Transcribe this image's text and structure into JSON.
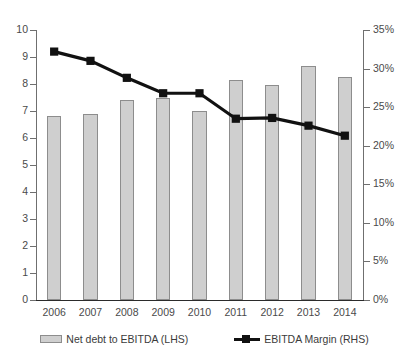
{
  "chart_data": {
    "type": "bar",
    "title": "",
    "subtitle": "",
    "xlabel": "",
    "ylabel": "",
    "grid": false,
    "legend_position": "bottom",
    "categories": [
      "2006",
      "2007",
      "2008",
      "2009",
      "2010",
      "2011",
      "2012",
      "2013",
      "2014"
    ],
    "axes": {
      "left": {
        "label": "",
        "min": 0,
        "max": 10,
        "step": 1,
        "ticks": [
          "0",
          "1",
          "2",
          "3",
          "4",
          "5",
          "6",
          "7",
          "8",
          "9",
          "10"
        ],
        "tick_values": [
          0,
          1,
          2,
          3,
          4,
          5,
          6,
          7,
          8,
          9,
          10
        ]
      },
      "right": {
        "label": "",
        "min": 0,
        "max": 35,
        "step": 5,
        "ticks": [
          "0%",
          "5%",
          "10%",
          "15%",
          "20%",
          "25%",
          "30%",
          "35%"
        ],
        "tick_values": [
          0,
          5,
          10,
          15,
          20,
          25,
          30,
          35
        ]
      }
    },
    "series": [
      {
        "name": "Net debt to EBITDA (LHS)",
        "type": "bar",
        "axis": "left",
        "color": "#cfcfcf",
        "border_color": "#8d8d8d",
        "values": [
          6.8,
          6.9,
          7.4,
          7.5,
          7.0,
          8.15,
          7.95,
          8.65,
          8.25
        ]
      },
      {
        "name": "EBITDA Margin (RHS)",
        "type": "line",
        "axis": "right",
        "color": "#111111",
        "marker": "square",
        "values": [
          32.2,
          31.0,
          28.8,
          26.8,
          26.8,
          23.5,
          23.6,
          22.6,
          21.3
        ]
      }
    ]
  },
  "legend": {
    "items": [
      {
        "label": "Net debt to EBITDA (LHS)",
        "swatch": "bar-swatch"
      },
      {
        "label": "EBITDA Margin (RHS)",
        "swatch": "line-marker-swatch"
      }
    ]
  },
  "colors": {
    "bar_fill": "#cfcfcf",
    "bar_border": "#8d8d8d",
    "line": "#111111",
    "axis": "#6f6f6f",
    "text": "#3b3b3b",
    "background": "#ffffff"
  }
}
